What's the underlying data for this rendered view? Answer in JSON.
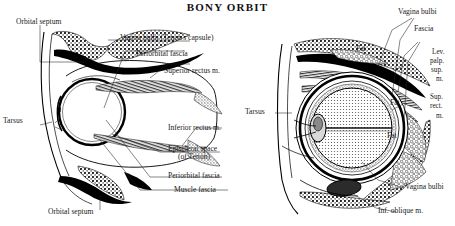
{
  "figure": {
    "title": "BONY ORBIT",
    "type": "anatomical-illustration",
    "panels": [
      {
        "id": "left-panel",
        "view": "sagittal-section-of-orbit",
        "labels": [
          {
            "key": "orbital_septum_top",
            "text": "Orbital septum"
          },
          {
            "key": "vagina_bulbi",
            "text": "Vagina bulbi (Tenon's capsule)"
          },
          {
            "key": "periorbital_fascia_top",
            "text": "Periorbital fascia"
          },
          {
            "key": "superior_rectus",
            "text": "Superior rectus m."
          },
          {
            "key": "tarsus",
            "text": "Tarsus"
          },
          {
            "key": "inferior_rectus",
            "text": "Inferior rectus m."
          },
          {
            "key": "episcleral_space_1",
            "text": "Episcleral space"
          },
          {
            "key": "episcleral_space_2",
            "text": "(of Tenon)"
          },
          {
            "key": "periorbital_fascia_bottom",
            "text": "Periorbital fascia"
          },
          {
            "key": "muscle_fascia",
            "text": "Muscle fascia"
          },
          {
            "key": "orbital_septum_bottom",
            "text": "Orbital septum"
          }
        ]
      },
      {
        "id": "right-panel",
        "view": "anterior-view-of-orbit",
        "labels": [
          {
            "key": "vagina_bulbi_top",
            "text": "Vagina bulbi"
          },
          {
            "key": "fascia",
            "text": "Fascia"
          },
          {
            "key": "lev_palp_1",
            "text": "Lev."
          },
          {
            "key": "lev_palp_2",
            "text": "palp."
          },
          {
            "key": "lev_palp_3",
            "text": "sup."
          },
          {
            "key": "lev_palp_4",
            "text": "m."
          },
          {
            "key": "sup_rect_1",
            "text": "Sup."
          },
          {
            "key": "sup_rect_2",
            "text": "rect."
          },
          {
            "key": "sup_rect_3",
            "text": "m."
          },
          {
            "key": "tarsus_right",
            "text": "Tarsus"
          },
          {
            "key": "fat_1",
            "text": "Fat"
          },
          {
            "key": "fat_2",
            "text": "Fat"
          },
          {
            "key": "fat_3",
            "text": "Fat"
          },
          {
            "key": "vagina_bulbi_bottom",
            "text": "Vagina bulbi"
          },
          {
            "key": "inf_oblique",
            "text": "Inf. oblique m."
          }
        ]
      }
    ]
  }
}
